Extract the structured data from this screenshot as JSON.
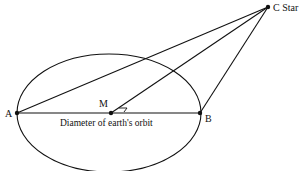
{
  "diagram": {
    "labels": {
      "A": "A",
      "B": "B",
      "M": "M",
      "C": "C Star",
      "diameter": "Diameter of earth's orbit"
    },
    "points": {
      "A": [
        17,
        113
      ],
      "B": [
        200,
        113
      ],
      "M": [
        111,
        113
      ],
      "C": [
        268,
        7
      ]
    },
    "orbit": {
      "cx": 109,
      "cy": 113,
      "rx": 92,
      "ry": 59
    },
    "colors": {
      "stroke": "#111111",
      "background": "#ffffff"
    }
  }
}
